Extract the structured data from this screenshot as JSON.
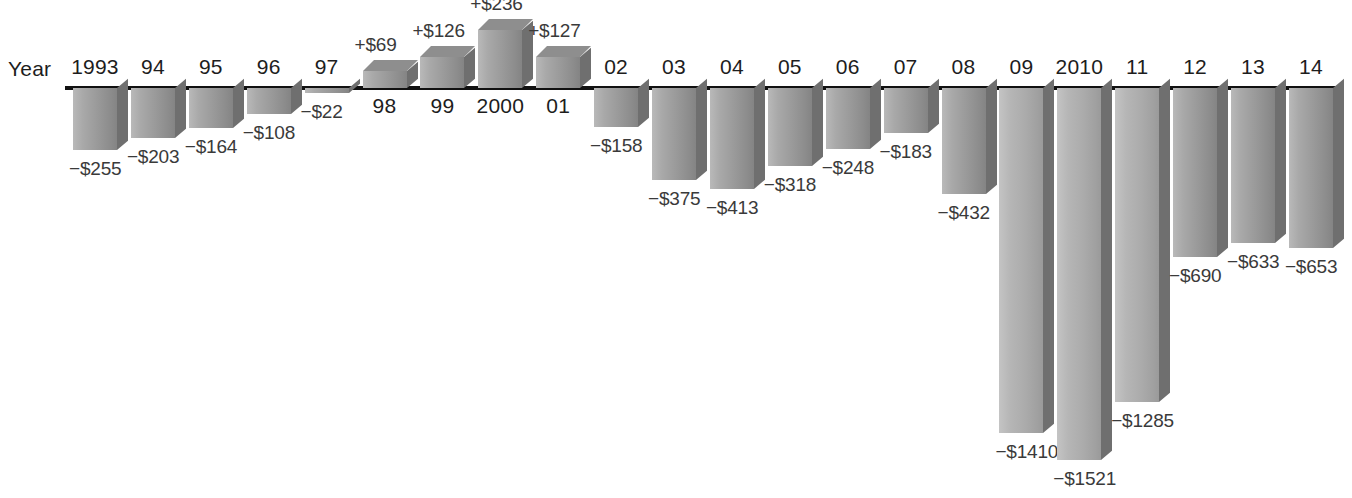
{
  "chart_data": {
    "type": "bar",
    "title": "",
    "subtitle": "",
    "xlabel": "Year",
    "ylabel": "",
    "grid": false,
    "legend": "none",
    "units": "billions of dollars",
    "baseline_value": 0,
    "ylim": [
      -1521,
      236
    ],
    "categories": [
      "1993",
      "94",
      "95",
      "96",
      "97",
      "98",
      "99",
      "2000",
      "01",
      "02",
      "03",
      "04",
      "05",
      "06",
      "07",
      "08",
      "09",
      "2010",
      "11",
      "12",
      "13",
      "14"
    ],
    "values": [
      -255,
      -203,
      -164,
      -108,
      -22,
      69,
      126,
      236,
      127,
      -158,
      -375,
      -413,
      -318,
      -248,
      -183,
      -432,
      -1410,
      -1521,
      -1285,
      -690,
      -633,
      -653
    ],
    "value_labels": [
      "−$255",
      "−$203",
      "−$164",
      "−$108",
      "−$22",
      "+$69",
      "+$126",
      "+$236",
      "+$127",
      "−$158",
      "−$375",
      "−$413",
      "−$318",
      "−$248",
      "−$183",
      "−$432",
      "−$1410",
      "−$1521",
      "−$1285",
      "−$690",
      "−$633",
      "−$653"
    ]
  },
  "axis": {
    "year_caption": "Year"
  },
  "colors": {
    "bar_light": "#b4b4b4",
    "bar_dark": "#8a8a8a",
    "bar_side": "#6f6f6f",
    "baseline": "#111111",
    "label_text": "#3a3a3a",
    "year_text": "#1d1d1d",
    "background": "#ffffff"
  }
}
